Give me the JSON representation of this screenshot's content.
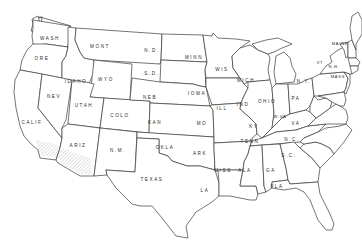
{
  "map": {
    "title": "",
    "type": "outline map of the contiguous United States",
    "line_color": "#3a3a3a",
    "background": "#ffffff",
    "hatched_region": "Southern California / Southwestern Arizona (desert region)",
    "states": {
      "wash": "WASH",
      "ore": "ORE",
      "calif": "CALIF",
      "idaho": "IDAHO",
      "nev": "NEV",
      "mont": "MONT",
      "wyo": "WYO",
      "utah": "UTAH",
      "ariz": "ARIZ",
      "colo": "COLO",
      "nm": "N.M.",
      "nd": "N.D.",
      "sd": "S.D.",
      "neb": "NEB",
      "kan": "KAN",
      "okla": "OKLA",
      "texas": "TEXAS",
      "minn": "MINN",
      "iowa": "IOWA",
      "mo": "MO",
      "ark": "ARK",
      "la": "LA",
      "wis": "WIS",
      "ill": "ILL",
      "mich": "MICH",
      "ind": "IND",
      "ohio": "OHIO",
      "ky": "KY",
      "tenn": "TENN",
      "miss": "MISS",
      "ala": "ALA",
      "ga": "GA",
      "fla": "FLA",
      "sc": "S.C.",
      "nc": "N.C.",
      "va": "VA",
      "wva": "W.VA",
      "pa": "PA",
      "ny": "N.Y.",
      "vt": "VT",
      "nh": "N.H.",
      "maine": "MAINE",
      "mass": "MASS",
      "md": "MD",
      "del": "DEL",
      "nj": "N.J."
    }
  }
}
